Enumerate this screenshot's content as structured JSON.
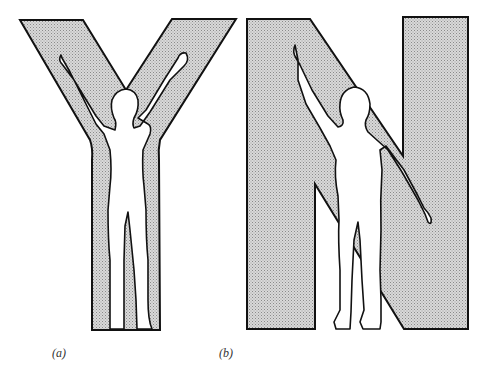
{
  "figure": {
    "panels": [
      {
        "id": "a",
        "letter": "Y",
        "caption": "(a)",
        "pose": "both arms raised in a Y shape"
      },
      {
        "id": "b",
        "letter": "N",
        "caption": "(b)",
        "pose": "left arm raised diagonally, right arm lowered diagonally forming N"
      }
    ],
    "colors": {
      "letter_fill": "#c8c8c8",
      "outline": "#111111",
      "figure_fill": "#ffffff",
      "background": "#ffffff"
    }
  }
}
